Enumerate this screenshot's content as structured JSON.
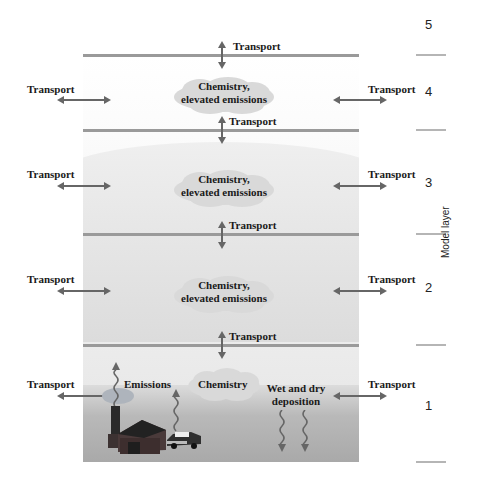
{
  "diagram": {
    "title": "",
    "axis_label": "Model layer",
    "layer_numbers": [
      "5",
      "4",
      "3",
      "2",
      "1"
    ],
    "transport_label": "Transport",
    "cloud_label_line1": "Chemistry,",
    "cloud_label_line2": "elevated emissions",
    "surface": {
      "emissions_label": "Emissions",
      "chemistry_label": "Chemistry",
      "deposition_line1": "Wet and dry",
      "deposition_line2": "deposition"
    },
    "colors": {
      "arrow": "#666666",
      "layer_line": "#9a9a9a",
      "cloud": "#d8d8d8"
    }
  }
}
